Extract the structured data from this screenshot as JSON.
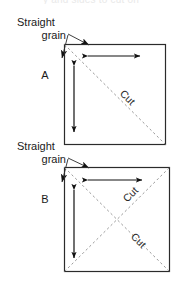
{
  "figure": {
    "title_partial": "y and sides to cut on",
    "diagrams": [
      {
        "id": "A",
        "letter": "A",
        "grain_label_line1": "Straight",
        "grain_label_line2": "grain",
        "cut_labels": [
          "Cut"
        ],
        "cut_count": 1,
        "arrows": [
          "horizontal-double",
          "vertical-double"
        ],
        "square": {
          "x": 64,
          "y": 44,
          "size": 101
        },
        "diagonals": [
          {
            "from": "top-left",
            "to": "bottom-right",
            "label": "Cut"
          }
        ]
      },
      {
        "id": "B",
        "letter": "B",
        "grain_label_line1": "Straight",
        "grain_label_line2": "grain",
        "cut_labels": [
          "Cut",
          "Cut"
        ],
        "cut_count": 2,
        "arrows": [
          "horizontal-double",
          "vertical-double"
        ],
        "square": {
          "x": 64,
          "y": 167,
          "size": 105
        },
        "diagonals": [
          {
            "from": "bottom-left",
            "to": "top-right",
            "label": "Cut"
          },
          {
            "from": "top-left",
            "to": "bottom-right",
            "label": "Cut"
          }
        ]
      }
    ],
    "colors": {
      "outline": "#2b2b2b",
      "dashed": "#9a9a9a",
      "arrow": "#111111",
      "text": "#1a1a1a",
      "background": "#ffffff"
    }
  }
}
